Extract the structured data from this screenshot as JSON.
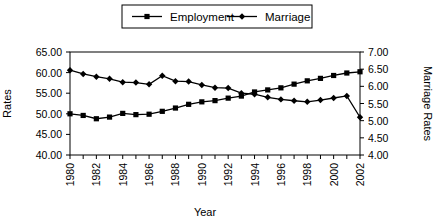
{
  "chart_data": {
    "type": "line",
    "title": "",
    "xlabel": "Year",
    "ylabel": "Rates",
    "y2label": "Marriage Rates",
    "grid": false,
    "legend_position": "top-center",
    "xlim": [
      1980,
      2002
    ],
    "ylim": [
      40.0,
      65.0
    ],
    "y2lim": [
      4.0,
      7.0
    ],
    "yticks": [
      "40.00",
      "45.00",
      "50.00",
      "55.00",
      "60.00",
      "65.00"
    ],
    "y2ticks": [
      "4.00",
      "4.50",
      "5.00",
      "5.50",
      "6.00",
      "6.50",
      "7.00"
    ],
    "x": [
      1980,
      1981,
      1982,
      1983,
      1984,
      1985,
      1986,
      1987,
      1988,
      1989,
      1990,
      1991,
      1992,
      1993,
      1994,
      1995,
      1996,
      1997,
      1998,
      1999,
      2000,
      2001,
      2002
    ],
    "xticklabels": [
      "1980",
      "1982",
      "1984",
      "1986",
      "1988",
      "1990",
      "1992",
      "1994",
      "1996",
      "1998",
      "2000",
      "2002"
    ],
    "series": [
      {
        "name": "Employment",
        "marker": "square",
        "axis": "left",
        "values": [
          50.0,
          49.6,
          48.8,
          49.2,
          50.1,
          49.8,
          49.9,
          50.6,
          51.4,
          52.3,
          52.9,
          53.2,
          53.8,
          54.3,
          55.3,
          55.8,
          56.3,
          57.2,
          58.0,
          58.6,
          59.3,
          59.9,
          60.2
        ]
      },
      {
        "name": "Marriage",
        "marker": "diamond",
        "axis": "right",
        "values": [
          6.47,
          6.36,
          6.28,
          6.22,
          6.12,
          6.11,
          6.06,
          6.31,
          6.15,
          6.14,
          6.04,
          5.96,
          5.95,
          5.8,
          5.77,
          5.68,
          5.62,
          5.58,
          5.55,
          5.6,
          5.66,
          5.72,
          5.1
        ]
      }
    ]
  },
  "legend": {
    "items": [
      {
        "label": "Employment"
      },
      {
        "label": "Marriage"
      }
    ]
  },
  "axes": {
    "left_title": "Rates",
    "right_title": "Marriage Rates",
    "bottom_title": "Year"
  }
}
